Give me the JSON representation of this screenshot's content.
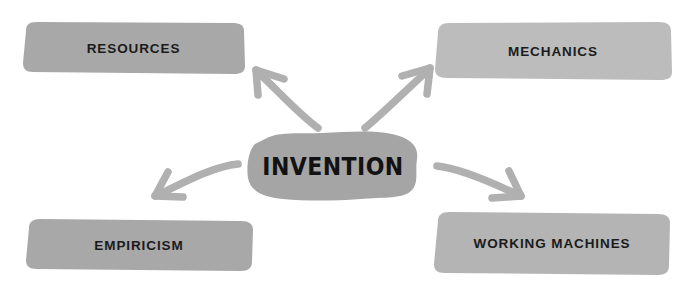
{
  "diagram": {
    "title_node": {
      "id": "center-node",
      "label": "INVENTION",
      "shape": "hand-drawn-blob",
      "fill": "#a5a5a5",
      "text_color": "#121212",
      "center": {
        "x": 333,
        "y": 166
      }
    },
    "background_color": "#ffffff",
    "nodes": [
      {
        "id": "resources",
        "label": "RESOURCES",
        "position": "top-left",
        "shape": "hand-drawn-rectangle",
        "fill": "#a8a8a8",
        "text_color": "#1b1b1b",
        "box": {
          "x": 22,
          "y": 22,
          "width": 223,
          "height": 52
        }
      },
      {
        "id": "mechanics",
        "label": "MECHANICS",
        "position": "top-right",
        "shape": "hand-drawn-rectangle",
        "fill": "#bcbcbc",
        "text_color": "#1b1b1b",
        "box": {
          "x": 434,
          "y": 22,
          "width": 238,
          "height": 58
        }
      },
      {
        "id": "empiricism",
        "label": "EMPIRICISM",
        "position": "bottom-left",
        "shape": "hand-drawn-rectangle",
        "fill": "#a8a8a8",
        "text_color": "#1b1b1b",
        "box": {
          "x": 25,
          "y": 219,
          "width": 228,
          "height": 52
        }
      },
      {
        "id": "working-machines",
        "label": "WORKING MACHINES",
        "position": "bottom-right",
        "shape": "hand-drawn-rectangle",
        "fill": "#b4b4b4",
        "text_color": "#1b1b1b",
        "box": {
          "x": 434,
          "y": 212,
          "width": 236,
          "height": 63
        }
      }
    ],
    "arrows": [
      {
        "id": "arrow-to-resources",
        "from": "center-node",
        "to": "resources",
        "direction": "up-left",
        "color": "#b0b0b0"
      },
      {
        "id": "arrow-to-mechanics",
        "from": "center-node",
        "to": "mechanics",
        "direction": "up-right",
        "color": "#b0b0b0"
      },
      {
        "id": "arrow-to-empiricism",
        "from": "center-node",
        "to": "empiricism",
        "direction": "down-left",
        "color": "#b0b0b0"
      },
      {
        "id": "arrow-to-working-machines",
        "from": "center-node",
        "to": "working-machines",
        "direction": "down-right",
        "color": "#b0b0b0"
      }
    ]
  }
}
